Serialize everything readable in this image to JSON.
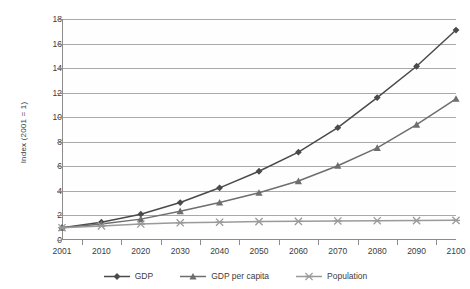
{
  "chart_data": {
    "type": "line",
    "title": "",
    "xlabel": "",
    "ylabel": "Index (2001 = 1)",
    "categories": [
      "2001",
      "2010",
      "2020",
      "2030",
      "2040",
      "2050",
      "2060",
      "2070",
      "2080",
      "2090",
      "2100"
    ],
    "ylim": [
      0,
      18
    ],
    "yticks": [
      0,
      2,
      4,
      6,
      8,
      10,
      12,
      14,
      16,
      18
    ],
    "grid": true,
    "legend_position": "bottom",
    "series": [
      {
        "name": "GDP",
        "marker": "diamond",
        "color": "#4a4a4a",
        "values": [
          1.0,
          1.45,
          2.1,
          3.05,
          4.25,
          5.6,
          7.15,
          9.15,
          11.6,
          14.15,
          17.1
        ]
      },
      {
        "name": "GDP per capita",
        "marker": "triangle",
        "color": "#6e6e6e",
        "values": [
          1.0,
          1.3,
          1.7,
          2.35,
          3.05,
          3.85,
          4.8,
          6.05,
          7.5,
          9.4,
          11.5
        ]
      },
      {
        "name": "Population",
        "marker": "star",
        "color": "#9a9a9a",
        "values": [
          1.0,
          1.15,
          1.3,
          1.4,
          1.45,
          1.5,
          1.52,
          1.55,
          1.57,
          1.58,
          1.6
        ]
      }
    ]
  },
  "legend": {
    "items": [
      {
        "label": "GDP"
      },
      {
        "label": "GDP per capita"
      },
      {
        "label": "Population"
      }
    ]
  },
  "axis": {
    "y_title": "Index (2001 = 1)"
  }
}
